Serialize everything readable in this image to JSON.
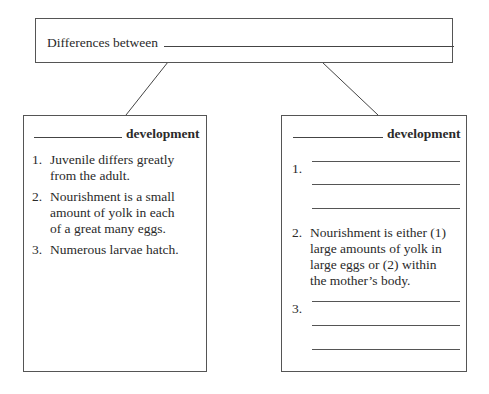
{
  "title": {
    "prefix": "Differences between"
  },
  "left_box": {
    "heading_suffix": "development",
    "items": [
      {
        "num": "1.",
        "lines": [
          "Juvenile differs greatly",
          "from the adult."
        ]
      },
      {
        "num": "2.",
        "lines": [
          "Nourishment is a small",
          "amount of yolk in each",
          "of a great many eggs."
        ]
      },
      {
        "num": "3.",
        "lines": [
          "Numerous larvae hatch."
        ]
      }
    ]
  },
  "right_box": {
    "heading_suffix": "development",
    "items": [
      {
        "num": "1.",
        "blank_lines": 3
      },
      {
        "num": "2.",
        "lines": [
          "Nourishment is either (1)",
          "large amounts of yolk in",
          "large eggs or (2) within",
          "the mother’s body."
        ]
      },
      {
        "num": "3.",
        "blank_lines": 3
      }
    ]
  }
}
